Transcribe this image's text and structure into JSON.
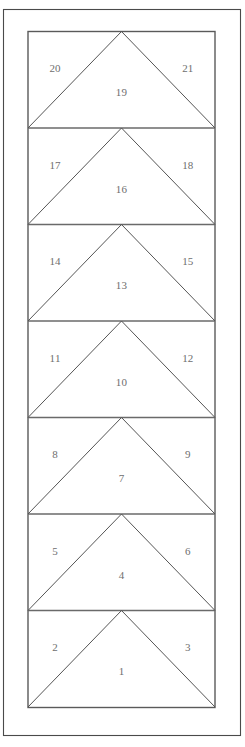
{
  "figure": {
    "title": "",
    "canvas": {
      "width": 245,
      "height": 747
    },
    "colors": {
      "background": "#ffffff",
      "outer_frame_stroke": "#4a4a4a",
      "inner_rect_stroke": "#5a5a5a",
      "divider_stroke": "#6a6a6a",
      "triangle_stroke": "#555555",
      "label_text": "#6e6e6e"
    },
    "outer_frame": {
      "x": 3.5,
      "y": 9.5,
      "width": 237,
      "height": 726
    },
    "inner_rect": {
      "x": 28,
      "y": 31.5,
      "width": 187,
      "height": 676
    },
    "band_count": 7,
    "band_height": 96.5,
    "band_divider_y": [
      128.0,
      224.5,
      321.0,
      417.5,
      514.0,
      610.5
    ],
    "bands": [
      {
        "index": 7,
        "top": 31.5,
        "bottom": 128.0,
        "center_label": "19",
        "left_label": "20",
        "right_label": "21"
      },
      {
        "index": 6,
        "top": 128.0,
        "bottom": 224.5,
        "center_label": "16",
        "left_label": "17",
        "right_label": "18"
      },
      {
        "index": 5,
        "top": 224.5,
        "bottom": 321.0,
        "center_label": "13",
        "left_label": "14",
        "right_label": "15"
      },
      {
        "index": 4,
        "top": 321.0,
        "bottom": 417.5,
        "center_label": "10",
        "left_label": "11",
        "right_label": "12"
      },
      {
        "index": 3,
        "top": 417.5,
        "bottom": 514.0,
        "center_label": "7",
        "left_label": "8",
        "right_label": "9"
      },
      {
        "index": 2,
        "top": 514.0,
        "bottom": 610.5,
        "center_label": "4",
        "left_label": "5",
        "right_label": "6"
      },
      {
        "index": 1,
        "top": 610.5,
        "bottom": 707.0,
        "center_label": "1",
        "left_label": "2",
        "right_label": "3"
      }
    ],
    "all_region_numbers": [
      "1",
      "2",
      "3",
      "4",
      "5",
      "6",
      "7",
      "8",
      "9",
      "10",
      "11",
      "12",
      "13",
      "14",
      "15",
      "16",
      "17",
      "18",
      "19",
      "20",
      "21"
    ]
  }
}
